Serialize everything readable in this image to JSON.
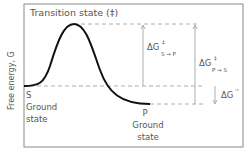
{
  "diagram": {
    "type": "reaction-coordinate-energy-diagram",
    "y_axis_label": "Free energy, G",
    "transition_state_label": "Transition state (‡)",
    "start": {
      "symbol": "S",
      "line1": "Ground",
      "line2": "state"
    },
    "end": {
      "symbol": "P",
      "line1": "Ground",
      "line2": "state"
    },
    "annotations": {
      "forward_barrier": {
        "base": "ΔG",
        "sup": "‡",
        "sub": "S → P"
      },
      "reverse_barrier": {
        "base": "ΔG",
        "sup": "‡",
        "sub": "P → S"
      },
      "standard_change": {
        "base": "ΔG",
        "sup": "'°"
      }
    },
    "colors": {
      "curve": "#111111",
      "guides": "#9a9a9a",
      "frame": "#8a8a8a",
      "text": "#555555"
    }
  }
}
